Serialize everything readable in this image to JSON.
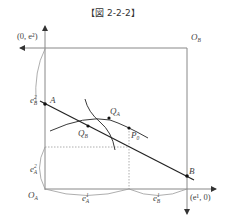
{
  "title": "【図 2-2-2】",
  "labels": {
    "top_left_coord": "(0, e²)",
    "bottom_right_coord": "(e¹, 0)",
    "origin_a": "O",
    "origin_a_sub": "A",
    "origin_b": "O",
    "origin_b_sub": "B",
    "point_a": "A",
    "point_b": "B",
    "point_qa": "Q",
    "point_qa_sub": "A",
    "point_qb": "Q",
    "point_qb_sub": "B",
    "point_p0": "P",
    "point_p0_sub": "0",
    "e2_b": "e",
    "e2_b_sup": "2",
    "e2_b_sub": "B",
    "e2_a": "e",
    "e2_a_sup": "2",
    "e2_a_sub": "A",
    "e1_a": "e",
    "e1_a_sup": "1",
    "e1_a_sub": "A",
    "e1_b": "e",
    "e1_b_sup": "1",
    "e1_b_sub": "B"
  },
  "colors": {
    "axis": "#8a8a8a",
    "line": "#222222",
    "dotted": "#9a9a9a"
  }
}
